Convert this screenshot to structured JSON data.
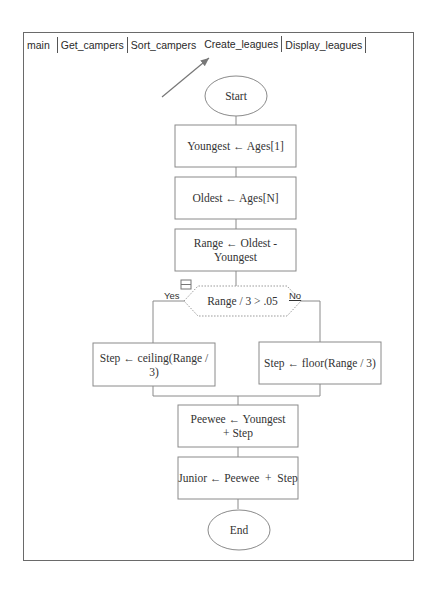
{
  "tabs": [
    {
      "label": "main",
      "active": false
    },
    {
      "label": "Get_campers",
      "active": false
    },
    {
      "label": "Sort_campers",
      "active": false
    },
    {
      "label": "Create_leagues",
      "active": true
    },
    {
      "label": "Display_leagues",
      "active": false
    }
  ],
  "flowchart": {
    "start": "Start",
    "steps": [
      "Youngest ← Ages[1]",
      "Oldest ← Ages[N]",
      "Range ← Oldest  - Youngest"
    ],
    "decision": {
      "condition": "Range / 3 > .05",
      "yes_label": "Yes",
      "no_label": "No",
      "yes_step": "Step ← ceiling(Range / 3)",
      "no_step": "Step ← floor(Range / 3)"
    },
    "after": [
      "Peewee ← Youngest  + Step",
      "Junior ← Peewee  +  Step"
    ],
    "end": "End"
  },
  "colors": {
    "line": "#8a8a8a",
    "frame": "#6a6a6a",
    "arrow": "#777777"
  }
}
